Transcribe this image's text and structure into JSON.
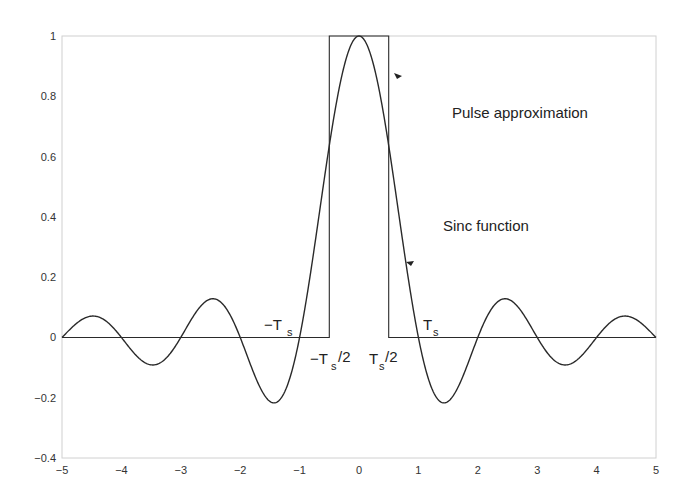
{
  "chart_data": {
    "type": "line",
    "title": "",
    "xlabel": "",
    "ylabel": "",
    "xlim": [
      -5,
      5
    ],
    "ylim": [
      -0.4,
      1
    ],
    "grid": false,
    "x_ticks": [
      "-5",
      "-4",
      "-3",
      "-2",
      "-1",
      "0",
      "1",
      "2",
      "3",
      "4",
      "5"
    ],
    "y_ticks": [
      "-0.4",
      "-0.2",
      "0",
      "0.2",
      "0.4",
      "0.6",
      "0.8",
      "1"
    ],
    "series": [
      {
        "name": "Sinc function",
        "formula": "sin(pi x)/(pi x)",
        "x": [
          -5,
          -4.5,
          -4,
          -3.5,
          -3,
          -2.5,
          -2,
          -1.5,
          -1,
          -0.5,
          0,
          0.5,
          1,
          1.5,
          2,
          2.5,
          3,
          3.5,
          4,
          4.5,
          5
        ],
        "values": [
          0,
          0.0707,
          0,
          -0.0909,
          0,
          0.1273,
          0,
          -0.2122,
          0,
          0.6366,
          1,
          0.6366,
          0,
          -0.2122,
          0,
          0.1273,
          0,
          -0.0909,
          0,
          0.0707,
          0
        ]
      },
      {
        "name": "Pulse approximation",
        "x": [
          -5,
          -0.5,
          -0.5,
          0.5,
          0.5,
          5
        ],
        "values": [
          0,
          0,
          1,
          1,
          0,
          0
        ]
      }
    ],
    "annotations": [
      {
        "text": "Pulse approximation",
        "x": 1.5,
        "y": 0.77
      },
      {
        "text": "Sinc function",
        "x": 1.4,
        "y": 0.37
      },
      {
        "text": "-T",
        "sub": "s",
        "x": -0.85,
        "y": 0.08
      },
      {
        "text": "T",
        "sub": "s",
        "x": 1.1,
        "y": 0.08
      },
      {
        "text": "-T",
        "sub": "s",
        "suffix": "/2",
        "x": -0.55,
        "y": -0.06
      },
      {
        "text": "T",
        "sub": "s",
        "suffix": "/2",
        "x": 0.35,
        "y": -0.06
      }
    ]
  },
  "labels": {
    "pulse": "Pulse approximation",
    "sinc": "Sinc function",
    "neg_ts": "−T",
    "pos_ts": "T",
    "sub_s": "s",
    "half": "/2",
    "neg_ts_half": "−T",
    "pos_ts_half": "T"
  },
  "colors": {
    "curve": "#2a2a2a",
    "axes": "#cfcfcf",
    "text": "#222222"
  }
}
